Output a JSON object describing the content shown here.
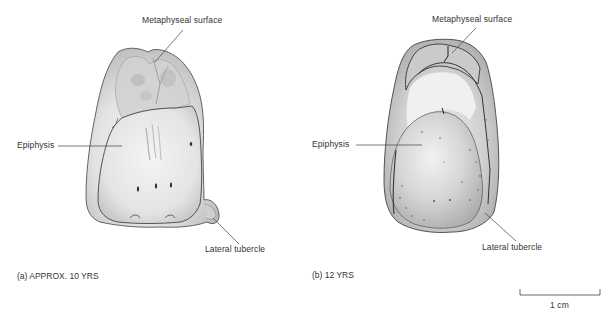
{
  "figure": {
    "panels": [
      {
        "id": "a",
        "caption": "(a) APPROX. 10 YRS",
        "labels": {
          "metaphyseal": "Metaphyseal surface",
          "epiphysis": "Epiphysis",
          "lateral": "Lateral tubercle"
        }
      },
      {
        "id": "b",
        "caption": "(b) 12 YRS",
        "labels": {
          "metaphyseal": "Metaphyseal surface",
          "epiphysis": "Epiphysis",
          "lateral": "Lateral tubercle"
        }
      }
    ],
    "scale_bar": {
      "label": "1 cm"
    }
  }
}
